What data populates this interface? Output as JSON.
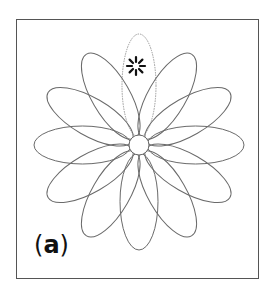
{
  "figure": {
    "panel_label_open": "(",
    "panel_label_letter": "a",
    "panel_label_close": ")",
    "marker_symbol": "asterisk",
    "petal_count": 12,
    "highlighted_petal": "top",
    "colors": {
      "outline": "#6a6a6a",
      "highlight_petal": "#9a9a9a",
      "frame": "#555555",
      "marker": "#111111"
    }
  }
}
